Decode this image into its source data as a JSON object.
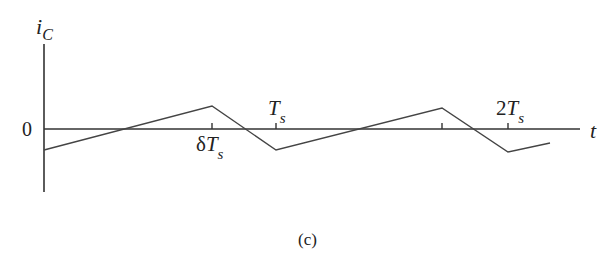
{
  "figure": {
    "caption": "(c)",
    "y_axis": {
      "symbol": "i",
      "subscript": "C"
    },
    "x_axis": {
      "symbol": "t"
    },
    "origin_label": "0",
    "ticks": [
      {
        "main": "δT",
        "sub": "s",
        "position": "below"
      },
      {
        "main": "T",
        "sub": "s",
        "position": "above"
      },
      {
        "main": "",
        "sub": "",
        "position": "none"
      },
      {
        "main": "2T",
        "sub": "s",
        "position": "above"
      }
    ]
  },
  "chart_data": {
    "type": "line",
    "title": "",
    "xlabel": "t",
    "ylabel": "i_C",
    "x_tick_labels": [
      "δTs",
      "Ts",
      "(1+δ)Ts",
      "2Ts"
    ],
    "points_normalized": [
      {
        "t": 0.0,
        "i": -1.0
      },
      {
        "t": 0.72,
        "i": 1.0
      },
      {
        "t": 1.0,
        "i": -1.0
      },
      {
        "t": 1.72,
        "i": 1.0
      },
      {
        "t": 2.0,
        "i": -1.0
      },
      {
        "t": 2.18,
        "i": -0.65
      }
    ],
    "grid": false,
    "legend": "none"
  }
}
